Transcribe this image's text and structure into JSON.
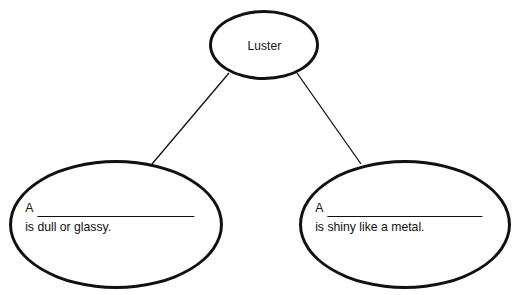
{
  "diagram": {
    "type": "concept-map",
    "orientation": "top-down",
    "background_color": "#ffffff",
    "stroke_color": "#111111",
    "root": {
      "label": "Luster",
      "shape": "ellipse"
    },
    "branches": [
      {
        "id": "dull",
        "shape": "ellipse",
        "article": "A",
        "blank": "",
        "predicate": "is dull or glassy."
      },
      {
        "id": "shiny",
        "shape": "ellipse",
        "article": "A",
        "blank": "",
        "predicate": "is shiny like a metal."
      }
    ],
    "connectors": [
      {
        "id": "root-to-dull",
        "from": "root",
        "to": "dull"
      },
      {
        "id": "root-to-shiny",
        "from": "root",
        "to": "shiny"
      }
    ]
  }
}
